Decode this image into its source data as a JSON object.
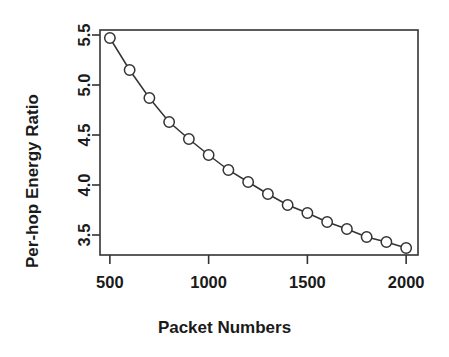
{
  "chart_data": {
    "type": "line",
    "title": "",
    "subtitle": "",
    "xlabel": "Packet Numbers",
    "ylabel": "Per-hop Energy Ratio",
    "x": [
      500,
      600,
      700,
      800,
      900,
      1000,
      1100,
      1200,
      1300,
      1400,
      1500,
      1600,
      1700,
      1800,
      1900,
      2000
    ],
    "values": [
      5.47,
      5.15,
      4.87,
      4.63,
      4.46,
      4.3,
      4.15,
      4.03,
      3.91,
      3.8,
      3.72,
      3.63,
      3.56,
      3.48,
      3.43,
      3.37
    ],
    "series": [
      {
        "name": "Per-hop Energy Ratio",
        "values": [
          5.47,
          5.15,
          4.87,
          4.63,
          4.46,
          4.3,
          4.15,
          4.03,
          3.91,
          3.8,
          3.72,
          3.63,
          3.56,
          3.48,
          3.43,
          3.37
        ]
      }
    ],
    "xlim": [
      450,
      2060
    ],
    "ylim": [
      3.3,
      5.55
    ],
    "xticks": [
      500,
      1000,
      1500,
      2000
    ],
    "xtick_labels": [
      "500",
      "1000",
      "1500",
      "2000"
    ],
    "yticks": [
      3.5,
      4.0,
      4.5,
      5.0,
      5.5
    ],
    "ytick_labels": [
      "3.5",
      "4.0",
      "4.5",
      "5.0",
      "5.5"
    ],
    "grid": false,
    "legend": "none",
    "marker": "open-circle",
    "line_color": "#333333",
    "marker_color": "#333333",
    "marker_fill": "#ffffff",
    "axis_color": "#333333",
    "background": "#ffffff"
  },
  "axis_titles": {
    "x": "Packet Numbers",
    "y": "Per-hop Energy Ratio"
  }
}
